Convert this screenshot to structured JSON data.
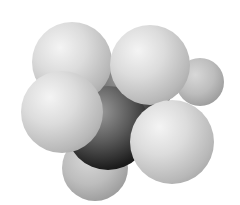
{
  "image": {
    "subject": "space-filling molecular model",
    "molecule": "ethane",
    "atoms": [
      {
        "element": "C",
        "x": 128,
        "y": 95,
        "r": 42,
        "color": "#1c1c1c"
      },
      {
        "element": "C",
        "x": 108,
        "y": 128,
        "r": 42,
        "color": "#1c1c1c"
      },
      {
        "element": "H",
        "x": 200,
        "y": 82,
        "r": 24,
        "color": "#bdbdbd"
      },
      {
        "element": "H",
        "x": 95,
        "y": 168,
        "r": 33,
        "color": "#bdbdbd"
      },
      {
        "element": "H",
        "x": 72,
        "y": 62,
        "r": 40,
        "color": "#dcdcdc"
      },
      {
        "element": "H",
        "x": 150,
        "y": 65,
        "r": 40,
        "color": "#dcdcdc"
      },
      {
        "element": "H",
        "x": 172,
        "y": 142,
        "r": 42,
        "color": "#dcdcdc"
      },
      {
        "element": "H",
        "x": 62,
        "y": 112,
        "r": 41,
        "color": "#dcdcdc"
      }
    ],
    "background": "#ffffff"
  }
}
